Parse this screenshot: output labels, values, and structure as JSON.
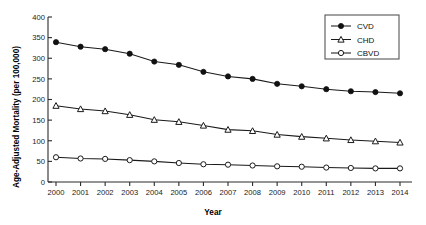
{
  "chart_data": {
    "type": "line",
    "title": "",
    "xlabel": "Year",
    "ylabel": "Age-Adjusted Mortality (per 100,000)",
    "categories": [
      "2000",
      "2001",
      "2002",
      "2003",
      "2004",
      "2005",
      "2006",
      "2007",
      "2008",
      "2009",
      "2010",
      "2011",
      "2012",
      "2013",
      "2014"
    ],
    "x": [
      2000,
      2001,
      2002,
      2003,
      2004,
      2005,
      2006,
      2007,
      2008,
      2009,
      2010,
      2011,
      2012,
      2013,
      2014
    ],
    "xlim": [
      2000,
      2014
    ],
    "ylim": [
      0,
      400
    ],
    "yticks": [
      0,
      50,
      100,
      150,
      200,
      250,
      300,
      350,
      400
    ],
    "ytick_labels": [
      "0",
      "50",
      "100",
      "150",
      "200",
      "250",
      "300",
      "350",
      "400"
    ],
    "grid": false,
    "legend_position": "top-right",
    "series": [
      {
        "name": "CVD",
        "marker": "filled-circle",
        "values": [
          339,
          328,
          322,
          311,
          292,
          284,
          267,
          256,
          250,
          238,
          232,
          225,
          220,
          218,
          215
        ]
      },
      {
        "name": "CHD",
        "marker": "open-triangle",
        "values": [
          185,
          177,
          172,
          163,
          151,
          146,
          137,
          127,
          124,
          115,
          110,
          106,
          102,
          99,
          96
        ]
      },
      {
        "name": "CBVD",
        "marker": "open-circle",
        "values": [
          60,
          57,
          56,
          53,
          50,
          46,
          43,
          42,
          40,
          38,
          37,
          35,
          34,
          33,
          33
        ]
      }
    ]
  },
  "legend": {
    "entries": [
      {
        "label": "CVD"
      },
      {
        "label": "CHD"
      },
      {
        "label": "CBVD"
      }
    ]
  },
  "colors": {
    "line": "#1a1a1a",
    "axis": "#2b2b2b",
    "marker_fill_open": "#ffffff",
    "marker_fill_solid": "#111111",
    "background": "#ffffff"
  }
}
